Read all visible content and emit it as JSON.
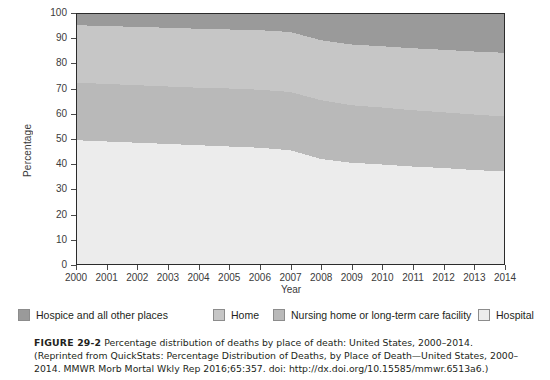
{
  "figure": {
    "label": "FIGURE 29-2",
    "caption_text": "Percentage distribution of deaths by place of death: United States, 2000–2014. (Reprinted from QuickStats: Percentage Distribution of Deaths, by Place of Death—United States, 2000–2014. MMWR Morb Mortal Wkly Rep 2016;65:357. doi: http://dx.doi.org/10.15585/mmwr.6513a6.)"
  },
  "axes": {
    "ylabel": "Percentage",
    "xlabel": "Year",
    "yticks": [
      0,
      10,
      20,
      30,
      40,
      50,
      60,
      70,
      80,
      90,
      100
    ],
    "xticks": [
      2000,
      2001,
      2002,
      2003,
      2004,
      2005,
      2006,
      2007,
      2008,
      2009,
      2010,
      2011,
      2012,
      2013,
      2014
    ]
  },
  "legend": [
    {
      "label": "Hospice and all other places",
      "color": "#9a9a9a",
      "x": 18
    },
    {
      "label": "Home",
      "color": "#c6c6c6",
      "x": 213
    },
    {
      "label": "Nursing home or long-term care facility",
      "color": "#b9b9b9",
      "x": 273
    },
    {
      "label": "Hospital",
      "color": "#ececec",
      "x": 478
    }
  ],
  "chart_data": {
    "type": "area",
    "stacked": true,
    "normalized_to_100": true,
    "title": "Percentage distribution of deaths by place of death: United States, 2000–2014",
    "xlabel": "Year",
    "ylabel": "Percentage",
    "xlim": [
      2000,
      2014
    ],
    "ylim": [
      0,
      100
    ],
    "grid": false,
    "legend_position": "bottom",
    "x": [
      2000,
      2001,
      2002,
      2003,
      2004,
      2005,
      2006,
      2007,
      2008,
      2009,
      2010,
      2011,
      2012,
      2013,
      2014
    ],
    "stack_order_bottom_to_top": [
      "Hospital",
      "Nursing home or long-term care facility",
      "Home",
      "Hospice and all other places"
    ],
    "series": [
      {
        "name": "Hospital",
        "color": "#ececec",
        "values": [
          49.5,
          49.0,
          48.5,
          48.0,
          47.5,
          47.0,
          46.5,
          45.5,
          42.0,
          40.5,
          39.8,
          39.0,
          38.4,
          37.6,
          37.0
        ]
      },
      {
        "name": "Nursing home or long-term care facility",
        "color": "#b9b9b9",
        "values": [
          23.0,
          23.0,
          23.0,
          23.0,
          23.0,
          23.2,
          23.2,
          23.3,
          23.5,
          23.0,
          22.8,
          22.5,
          22.3,
          22.2,
          22.0
        ]
      },
      {
        "name": "Home",
        "color": "#c6c6c6",
        "values": [
          23.0,
          23.2,
          23.3,
          23.5,
          23.6,
          23.6,
          23.8,
          24.0,
          24.0,
          24.3,
          24.5,
          24.8,
          25.0,
          25.2,
          25.5
        ]
      },
      {
        "name": "Hospice and all other places",
        "color": "#9a9a9a",
        "values": [
          4.5,
          4.8,
          5.2,
          5.5,
          5.9,
          6.2,
          6.5,
          7.2,
          10.5,
          12.2,
          12.9,
          13.7,
          14.3,
          15.0,
          15.5
        ]
      }
    ],
    "cumulative_upper_boundaries": {
      "Hospital": [
        49.5,
        49.0,
        48.5,
        48.0,
        47.5,
        47.0,
        46.5,
        45.5,
        42.0,
        40.5,
        39.8,
        39.0,
        38.4,
        37.6,
        37.0
      ],
      "Nursing home or long-term care facility": [
        72.5,
        72.0,
        71.5,
        71.0,
        70.5,
        70.2,
        69.7,
        68.8,
        65.5,
        63.5,
        62.6,
        61.5,
        60.7,
        59.8,
        59.0
      ],
      "Home": [
        95.5,
        95.2,
        94.8,
        94.5,
        94.1,
        93.8,
        93.5,
        92.8,
        89.5,
        87.8,
        87.1,
        86.3,
        85.7,
        85.0,
        84.5
      ],
      "Hospice and all other places": [
        100,
        100,
        100,
        100,
        100,
        100,
        100,
        100,
        100,
        100,
        100,
        100,
        100,
        100,
        100
      ]
    }
  }
}
